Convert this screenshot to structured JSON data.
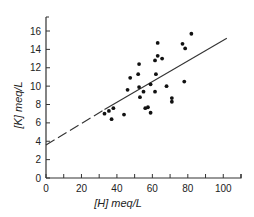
{
  "chart_data": {
    "type": "scatter",
    "title": "",
    "xlabel": "[H] meq/L",
    "ylabel": "[K] meq/L",
    "xlim": [
      0,
      110
    ],
    "ylim": [
      0,
      17
    ],
    "xticks": [
      0,
      20,
      40,
      60,
      80,
      100
    ],
    "yticks": [
      0,
      2,
      4,
      6,
      8,
      10,
      12,
      14,
      16
    ],
    "minor_xticks": [
      10,
      30,
      50,
      70,
      90,
      110
    ],
    "grid": false,
    "legend": "none",
    "series": [
      {
        "name": "observations",
        "points": [
          {
            "x": 33,
            "y": 7.0
          },
          {
            "x": 35.5,
            "y": 7.3
          },
          {
            "x": 37,
            "y": 6.4
          },
          {
            "x": 38,
            "y": 7.6
          },
          {
            "x": 44,
            "y": 6.9
          },
          {
            "x": 46,
            "y": 9.6
          },
          {
            "x": 47.5,
            "y": 10.9
          },
          {
            "x": 52,
            "y": 11.3
          },
          {
            "x": 52.5,
            "y": 12.4
          },
          {
            "x": 52.5,
            "y": 9.9
          },
          {
            "x": 53,
            "y": 8.8
          },
          {
            "x": 55,
            "y": 9.4
          },
          {
            "x": 56,
            "y": 7.6
          },
          {
            "x": 57.5,
            "y": 7.7
          },
          {
            "x": 59,
            "y": 7.1
          },
          {
            "x": 59,
            "y": 10.2
          },
          {
            "x": 61.5,
            "y": 9.4
          },
          {
            "x": 61.5,
            "y": 12.8
          },
          {
            "x": 62,
            "y": 11.3
          },
          {
            "x": 63,
            "y": 13.3
          },
          {
            "x": 63,
            "y": 14.7
          },
          {
            "x": 65.5,
            "y": 13.0
          },
          {
            "x": 68,
            "y": 10.0
          },
          {
            "x": 71,
            "y": 8.7
          },
          {
            "x": 71,
            "y": 8.3
          },
          {
            "x": 77,
            "y": 14.6
          },
          {
            "x": 78,
            "y": 10.5
          },
          {
            "x": 78.5,
            "y": 14.1
          },
          {
            "x": 82,
            "y": 15.7
          }
        ]
      }
    ],
    "fit_line": {
      "solid": {
        "x": [
          33,
          102
        ],
        "y": [
          7.45,
          15.2
        ]
      },
      "dashed_extrapolation": {
        "x": [
          0,
          33
        ],
        "y": [
          3.6,
          7.45
        ]
      }
    }
  }
}
